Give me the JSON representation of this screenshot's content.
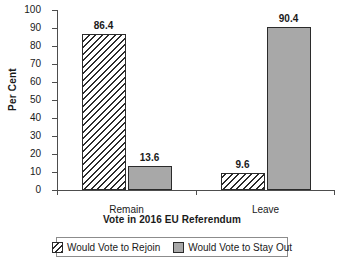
{
  "chart_data": {
    "type": "bar",
    "title": "",
    "xlabel": "Vote in 2016 EU Referendum",
    "ylabel": "Per Cent",
    "categories": [
      "Remain",
      "Leave"
    ],
    "series": [
      {
        "name": "Would Vote to Rejoin",
        "values": [
          86.4,
          9.6
        ],
        "fill": "hatch"
      },
      {
        "name": "Would Vote to Stay Out",
        "values": [
          13.6,
          90.4
        ],
        "fill": "solid"
      }
    ],
    "ylim": [
      0,
      100
    ],
    "ytick_values": [
      0,
      10,
      20,
      30,
      40,
      50,
      60,
      70,
      80,
      90,
      100
    ],
    "ytick_labels": [
      "0",
      "10",
      "20",
      "30",
      "40",
      "50",
      "60",
      "70",
      "80",
      "90",
      "100"
    ],
    "data_labels": [
      "86.4",
      "13.6",
      "9.6",
      "90.4"
    ],
    "grid": false,
    "legend_position": "bottom",
    "colors": {
      "solid_fill": "#a8a8a8",
      "outline": "#2b2b2b",
      "hatch_fill": "#ffffff",
      "axis": "#4d4d4d",
      "text": "#1a1a1a",
      "background": "#ffffff"
    }
  },
  "legend": {
    "items": [
      {
        "label": "Would Vote to Rejoin"
      },
      {
        "label": "Would Vote to Stay Out"
      }
    ]
  }
}
